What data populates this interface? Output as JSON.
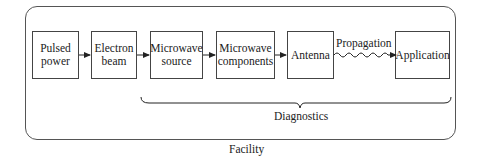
{
  "blocks": [
    {
      "id": "pulsed-power",
      "line1": "Pulsed",
      "line2": "power"
    },
    {
      "id": "electron-beam",
      "line1": "Electron",
      "line2": "beam"
    },
    {
      "id": "microwave-source",
      "line1": "Microwave",
      "line2": "source"
    },
    {
      "id": "microwave-components",
      "line1": "Microwave",
      "line2": "components"
    },
    {
      "id": "antenna",
      "line1": "Antenna",
      "line2": ""
    },
    {
      "id": "application",
      "line1": "Application",
      "line2": ""
    }
  ],
  "connections": [
    {
      "from": "pulsed-power",
      "to": "electron-beam",
      "style": "arrow"
    },
    {
      "from": "electron-beam",
      "to": "microwave-source",
      "style": "arrow"
    },
    {
      "from": "microwave-source",
      "to": "microwave-components",
      "style": "arrow"
    },
    {
      "from": "microwave-components",
      "to": "antenna",
      "style": "arrow"
    },
    {
      "from": "antenna",
      "to": "application",
      "style": "wavy-arrow",
      "label": "Propagation"
    }
  ],
  "propagation_label": "Propagation",
  "brace_label": "Diagnostics",
  "container_label": "Facility"
}
